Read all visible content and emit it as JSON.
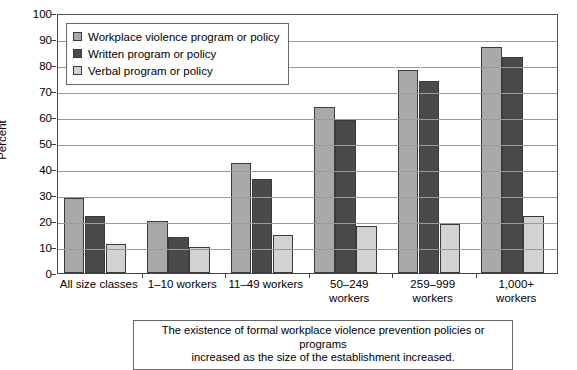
{
  "chart_data": {
    "type": "bar",
    "title": "",
    "xlabel": "",
    "ylabel": "Percent",
    "ylim": [
      0,
      100
    ],
    "ytick_step": 10,
    "yticks": [
      0,
      10,
      20,
      30,
      40,
      50,
      60,
      70,
      80,
      90,
      100
    ],
    "grid": true,
    "legend_position": "top-left inside plot",
    "categories": [
      "All size classes",
      "1–10 workers",
      "11–49 workers",
      "50–249 workers",
      "259–999 workers",
      "1,000+ workers"
    ],
    "series": [
      {
        "name": "Workplace violence program or policy",
        "color": "#a9a9a9",
        "values": [
          29,
          20,
          42.5,
          64,
          78,
          87
        ]
      },
      {
        "name": "Written program or policy",
        "color": "#4a4a4a",
        "values": [
          22,
          14,
          36,
          59,
          74,
          83
        ]
      },
      {
        "name": "Verbal program or policy",
        "color": "#d2d2d2",
        "values": [
          11,
          10,
          14.5,
          18,
          19,
          22
        ]
      }
    ],
    "annotation": "The existence of formal workplace violence prevention policies or programs increased as the size of the establishment increased."
  },
  "caption": {
    "line1": "The existence of formal workplace violence prevention policies or programs",
    "line2": "increased as the size of the establishment increased."
  },
  "xtick_labels": [
    [
      "All size classes"
    ],
    [
      "1–10 workers"
    ],
    [
      "11–49 workers"
    ],
    [
      "50–249",
      "workers"
    ],
    [
      "259–999",
      "workers"
    ],
    [
      "1,000+",
      "workers"
    ]
  ],
  "colors": {
    "series1": "#a9a9a9",
    "series2": "#4a4a4a",
    "series3": "#d2d2d2",
    "gridline": "#9a9a9a",
    "axis": "#444444",
    "border": "#666666"
  }
}
